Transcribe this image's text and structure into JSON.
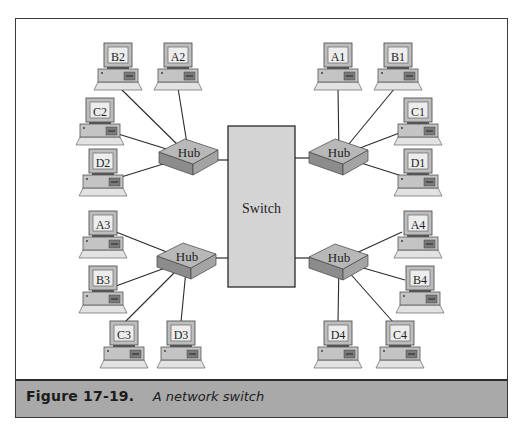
{
  "figure": {
    "caption_number": "Figure 17-19.",
    "caption_text": "A network switch"
  },
  "diagram": {
    "switch": {
      "label": "Switch"
    },
    "hubs": [
      {
        "id": "hub-top-left",
        "label": "Hub",
        "computers": [
          "B2",
          "A2",
          "C2",
          "D2"
        ]
      },
      {
        "id": "hub-top-right",
        "label": "Hub",
        "computers": [
          "A1",
          "B1",
          "C1",
          "D1"
        ]
      },
      {
        "id": "hub-bottom-left",
        "label": "Hub",
        "computers": [
          "A3",
          "B3",
          "C3",
          "D3"
        ]
      },
      {
        "id": "hub-bottom-right",
        "label": "Hub",
        "computers": [
          "A4",
          "B4",
          "D4",
          "C4"
        ]
      }
    ],
    "colors": {
      "switch_fill": "#d4d4d4",
      "hub_top": "#b8b8b8",
      "hub_side": "#8c8c8c",
      "caption_band": "#a9a9a9",
      "line": "#2a2a2a"
    }
  }
}
